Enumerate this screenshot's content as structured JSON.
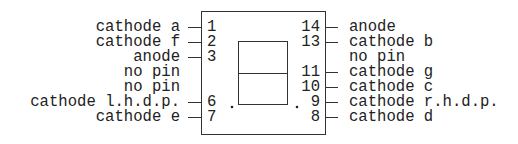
{
  "diagram": {
    "title": "",
    "type": "seven-segment display pinout",
    "left_pins": [
      {
        "pin": "1",
        "label": "cathode a",
        "connected": true
      },
      {
        "pin": "2",
        "label": "cathode f",
        "connected": true
      },
      {
        "pin": "3",
        "label": "anode",
        "connected": true
      },
      {
        "pin": "",
        "label": "no pin",
        "connected": false
      },
      {
        "pin": "",
        "label": "no pin",
        "connected": false
      },
      {
        "pin": "6",
        "label": "cathode l.h.d.p.",
        "connected": true
      },
      {
        "pin": "7",
        "label": "cathode e",
        "connected": true
      }
    ],
    "right_pins": [
      {
        "pin": "14",
        "label": "anode",
        "connected": true
      },
      {
        "pin": "13",
        "label": "cathode b",
        "connected": true
      },
      {
        "pin": "",
        "label": "no pin",
        "connected": false
      },
      {
        "pin": "11",
        "label": "cathode g",
        "connected": true
      },
      {
        "pin": "10",
        "label": "cathode c",
        "connected": true
      },
      {
        "pin": "9",
        "label": "cathode r.h.d.p.",
        "connected": true
      },
      {
        "pin": "8",
        "label": "cathode d",
        "connected": true
      }
    ],
    "decimal_points": [
      "left",
      "right"
    ],
    "colors": {
      "line": "#333333",
      "text": "#222222",
      "background": "#ffffff"
    }
  }
}
